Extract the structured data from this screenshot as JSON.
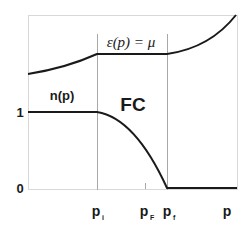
{
  "diagram": {
    "title_equation": "ε(p) = μ",
    "occupation_label": "n(p)",
    "region_label": "FC",
    "y_ticks": [
      "1",
      "0"
    ],
    "x_ticks": [
      {
        "main": "p",
        "sub": "i"
      },
      {
        "main": "p",
        "sub": "F"
      },
      {
        "main": "p",
        "sub": "f"
      }
    ],
    "x_axis_label": "p",
    "colors": {
      "curve": "#1a1a1a",
      "guide": "#b0b0b0",
      "frame": "#d0d0d0"
    }
  }
}
